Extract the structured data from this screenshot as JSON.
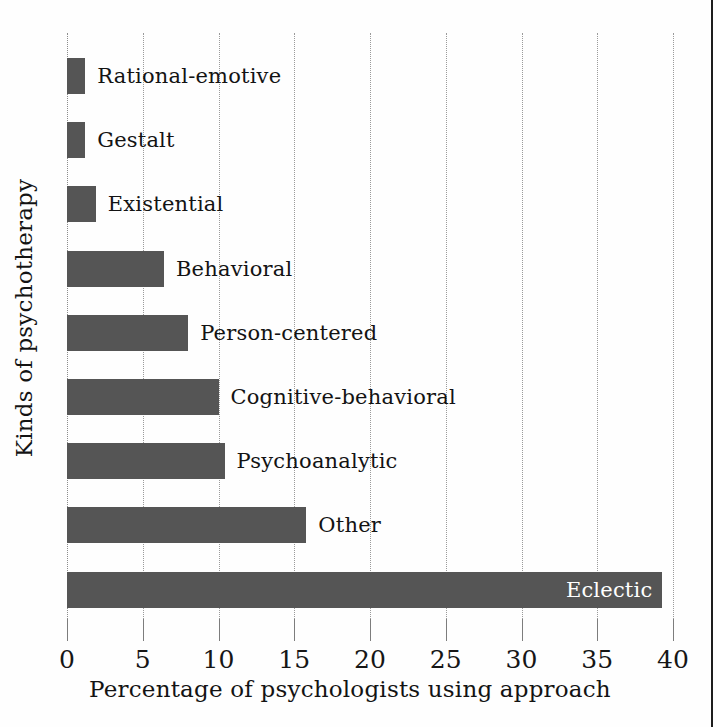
{
  "chart_data": {
    "type": "bar",
    "orientation": "horizontal",
    "title": "",
    "xlabel": "Percentage of psychologists using approach",
    "ylabel": "Kinds of psychotherapy",
    "xlim": [
      0,
      40
    ],
    "xticks": [
      0,
      5,
      10,
      15,
      20,
      25,
      30,
      35,
      40
    ],
    "xticklabels": [
      "0",
      "5",
      "10",
      "15",
      "20",
      "25",
      "30",
      "35",
      "40"
    ],
    "grid": "vertical-dotted",
    "legend": "none",
    "bar_color": "#555555",
    "categories": [
      "Rational-emotive",
      "Gestalt",
      "Existential",
      "Behavioral",
      "Person-centered",
      "Cognitive-behavioral",
      "Psychoanalytic",
      "Other",
      "Eclectic"
    ],
    "values": [
      1.2,
      1.2,
      1.9,
      6.4,
      8.0,
      10.0,
      10.4,
      15.8,
      39.3
    ],
    "bars": [
      {
        "label": "Rational-emotive",
        "value": 1.2,
        "label_position": "outside"
      },
      {
        "label": "Gestalt",
        "value": 1.2,
        "label_position": "outside"
      },
      {
        "label": "Existential",
        "value": 1.9,
        "label_position": "outside"
      },
      {
        "label": "Behavioral",
        "value": 6.4,
        "label_position": "outside"
      },
      {
        "label": "Person-centered",
        "value": 8.0,
        "label_position": "outside"
      },
      {
        "label": "Cognitive-behavioral",
        "value": 10.0,
        "label_position": "outside"
      },
      {
        "label": "Psychoanalytic",
        "value": 10.4,
        "label_position": "outside"
      },
      {
        "label": "Other",
        "value": 15.8,
        "label_position": "outside"
      },
      {
        "label": "Eclectic",
        "value": 39.3,
        "label_position": "inside"
      }
    ]
  }
}
